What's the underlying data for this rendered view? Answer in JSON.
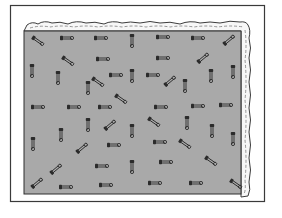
{
  "illustration": {
    "subject": "gray board covered with scattered safety pins, with a torn paper edge along the top and right",
    "colors": {
      "background": "#ffffff",
      "frame": "#3a3a3a",
      "board": "#a9a9a9",
      "board_border": "#2e2e2e",
      "paper": "#f7f7f7",
      "paper_outline": "#3c3c3c",
      "pin": "#2b2b2b"
    },
    "frame": {
      "x": 10,
      "y": 5,
      "w": 254,
      "h": 196
    },
    "board": {
      "x": 24,
      "y": 31,
      "w": 217,
      "h": 163
    },
    "pins": [
      {
        "x": 38,
        "y": 41,
        "o": "d1"
      },
      {
        "x": 67,
        "y": 38,
        "o": "h"
      },
      {
        "x": 101,
        "y": 38,
        "o": "h"
      },
      {
        "x": 132,
        "y": 41,
        "o": "v"
      },
      {
        "x": 163,
        "y": 37,
        "o": "h"
      },
      {
        "x": 198,
        "y": 38,
        "o": "h"
      },
      {
        "x": 229,
        "y": 40,
        "o": "d2"
      },
      {
        "x": 68,
        "y": 61,
        "o": "d1"
      },
      {
        "x": 103,
        "y": 59,
        "o": "h"
      },
      {
        "x": 163,
        "y": 58,
        "o": "h"
      },
      {
        "x": 203,
        "y": 58,
        "o": "d2"
      },
      {
        "x": 32,
        "y": 71,
        "o": "v"
      },
      {
        "x": 58,
        "y": 78,
        "o": "v"
      },
      {
        "x": 98,
        "y": 82,
        "o": "d1"
      },
      {
        "x": 116,
        "y": 75,
        "o": "h"
      },
      {
        "x": 132,
        "y": 76,
        "o": "v"
      },
      {
        "x": 153,
        "y": 75,
        "o": "h"
      },
      {
        "x": 170,
        "y": 81,
        "o": "d2"
      },
      {
        "x": 185,
        "y": 86,
        "o": "v"
      },
      {
        "x": 211,
        "y": 76,
        "o": "v"
      },
      {
        "x": 233,
        "y": 72,
        "o": "v"
      },
      {
        "x": 88,
        "y": 88,
        "o": "v"
      },
      {
        "x": 121,
        "y": 99,
        "o": "d1"
      },
      {
        "x": 38,
        "y": 107,
        "o": "h"
      },
      {
        "x": 74,
        "y": 107,
        "o": "h"
      },
      {
        "x": 105,
        "y": 107,
        "o": "h"
      },
      {
        "x": 161,
        "y": 107,
        "o": "h"
      },
      {
        "x": 198,
        "y": 106,
        "o": "h"
      },
      {
        "x": 226,
        "y": 105,
        "o": "h"
      },
      {
        "x": 88,
        "y": 125,
        "o": "v"
      },
      {
        "x": 110,
        "y": 125,
        "o": "d2"
      },
      {
        "x": 132,
        "y": 131,
        "o": "v"
      },
      {
        "x": 154,
        "y": 122,
        "o": "d1"
      },
      {
        "x": 187,
        "y": 123,
        "o": "v"
      },
      {
        "x": 61,
        "y": 135,
        "o": "v"
      },
      {
        "x": 212,
        "y": 131,
        "o": "v"
      },
      {
        "x": 233,
        "y": 139,
        "o": "v"
      },
      {
        "x": 33,
        "y": 144,
        "o": "v"
      },
      {
        "x": 82,
        "y": 148,
        "o": "d2"
      },
      {
        "x": 114,
        "y": 145,
        "o": "h"
      },
      {
        "x": 160,
        "y": 142,
        "o": "h"
      },
      {
        "x": 185,
        "y": 144,
        "o": "d1"
      },
      {
        "x": 132,
        "y": 167,
        "o": "v"
      },
      {
        "x": 102,
        "y": 166,
        "o": "h"
      },
      {
        "x": 56,
        "y": 169,
        "o": "d2"
      },
      {
        "x": 166,
        "y": 162,
        "o": "h"
      },
      {
        "x": 211,
        "y": 161,
        "o": "d1"
      },
      {
        "x": 37,
        "y": 183,
        "o": "d2"
      },
      {
        "x": 66,
        "y": 187,
        "o": "h"
      },
      {
        "x": 106,
        "y": 185,
        "o": "h"
      },
      {
        "x": 155,
        "y": 183,
        "o": "h"
      },
      {
        "x": 196,
        "y": 183,
        "o": "h"
      },
      {
        "x": 236,
        "y": 184,
        "o": "d1"
      }
    ]
  }
}
